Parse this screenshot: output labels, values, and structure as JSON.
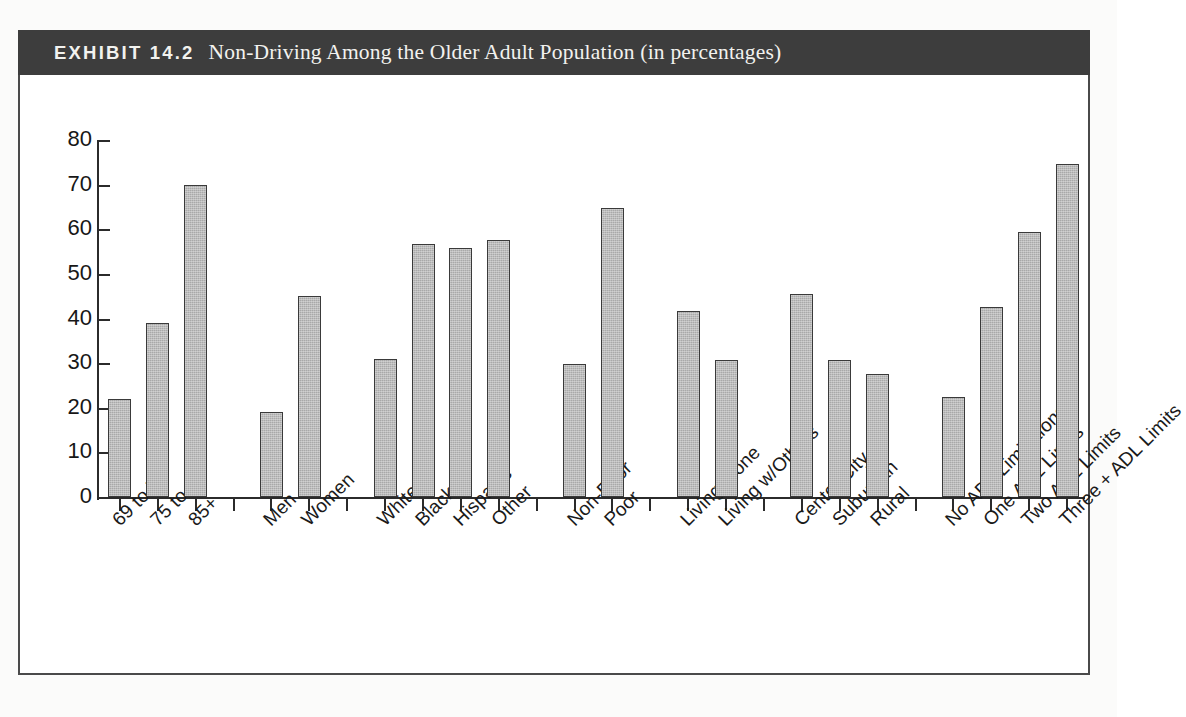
{
  "exhibit": {
    "label": "EXHIBIT 14.2",
    "title": "Non-Driving Among the Older Adult Population (in percentages)"
  },
  "colors": {
    "header_background": "#3d3d3d",
    "header_text": "#f2f2ef",
    "bar_fill": "#a9a9a9",
    "bar_stroke": "#3a3a3a",
    "axis": "#2b2b2b",
    "frame": "#4a4a4a",
    "page_background": "#ffffff"
  },
  "chart_data": {
    "type": "bar",
    "title": "Non-Driving Among the Older Adult Population (in percentages)",
    "xlabel": "",
    "ylabel": "",
    "ylim": [
      0,
      80
    ],
    "yticks": [
      0,
      10,
      20,
      30,
      40,
      50,
      60,
      70,
      80
    ],
    "grid": false,
    "legend": "none",
    "categories": [
      "69 to 74",
      "75 to 84",
      "85+",
      "Men",
      "Women",
      "White",
      "Black",
      "Hispanic",
      "Other",
      "Non-Poor",
      "Poor",
      "Living Alone",
      "Living w/Others",
      "Center City",
      "Suburban",
      "Rural",
      "No ADL Limitations",
      "One ADL Limits",
      "Two ADL Limits",
      "Three + ADL Limits"
    ],
    "values": [
      22.0,
      39.1,
      70.0,
      19.0,
      45.0,
      30.9,
      56.8,
      55.7,
      57.7,
      29.7,
      64.7,
      41.6,
      30.6,
      45.5,
      30.6,
      27.5,
      22.3,
      42.5,
      59.3,
      74.6
    ],
    "groups": [
      {
        "name": "Age",
        "categories": [
          "69 to 74",
          "75 to 84",
          "85+"
        ]
      },
      {
        "name": "Gender",
        "categories": [
          "Men",
          "Women"
        ]
      },
      {
        "name": "Race/Ethnicity",
        "categories": [
          "White",
          "Black",
          "Hispanic",
          "Other"
        ]
      },
      {
        "name": "Income",
        "categories": [
          "Non-Poor",
          "Poor"
        ]
      },
      {
        "name": "Living Arrangement",
        "categories": [
          "Living Alone",
          "Living w/Others"
        ]
      },
      {
        "name": "Residence",
        "categories": [
          "Center City",
          "Suburban",
          "Rural"
        ]
      },
      {
        "name": "ADL Limitations",
        "categories": [
          "No ADL Limitations",
          "One ADL Limits",
          "Two ADL Limits",
          "Three + ADL Limits"
        ]
      }
    ]
  }
}
